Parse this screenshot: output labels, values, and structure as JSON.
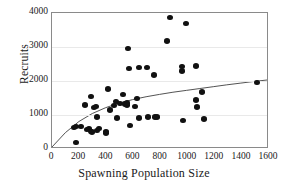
{
  "chart_data": {
    "type": "scatter",
    "title": "",
    "xlabel": "Spawning Population Size",
    "ylabel": "Recruits",
    "xlim": [
      0,
      1600
    ],
    "ylim": [
      0,
      4000
    ],
    "xticks": [
      0,
      200,
      400,
      600,
      800,
      1000,
      1200,
      1400,
      1600
    ],
    "yticks": [
      0,
      1000,
      2000,
      3000,
      4000
    ],
    "grid": "horizontal",
    "legend": "none",
    "marker_color": "#111111",
    "curve_color": "#404040",
    "points": [
      [
        175,
        195
      ],
      [
        165,
        640
      ],
      [
        180,
        670
      ],
      [
        215,
        660
      ],
      [
        240,
        1290
      ],
      [
        255,
        580
      ],
      [
        270,
        600
      ],
      [
        285,
        1550
      ],
      [
        290,
        510
      ],
      [
        295,
        495
      ],
      [
        310,
        1220
      ],
      [
        325,
        1255
      ],
      [
        330,
        940
      ],
      [
        335,
        545
      ],
      [
        345,
        600
      ],
      [
        395,
        510
      ],
      [
        400,
        470
      ],
      [
        410,
        1765
      ],
      [
        425,
        1145
      ],
      [
        455,
        1280
      ],
      [
        470,
        1400
      ],
      [
        480,
        910
      ],
      [
        500,
        1335
      ],
      [
        520,
        1605
      ],
      [
        540,
        1320
      ],
      [
        550,
        1290
      ],
      [
        555,
        1355
      ],
      [
        560,
        2950
      ],
      [
        565,
        2360
      ],
      [
        575,
        700
      ],
      [
        610,
        1250
      ],
      [
        630,
        1480
      ],
      [
        640,
        910
      ],
      [
        645,
        2390
      ],
      [
        700,
        2395
      ],
      [
        710,
        940
      ],
      [
        755,
        2180
      ],
      [
        760,
        945
      ],
      [
        775,
        940
      ],
      [
        850,
        3175
      ],
      [
        870,
        3865
      ],
      [
        955,
        2300
      ],
      [
        960,
        2420
      ],
      [
        965,
        830
      ],
      [
        985,
        3695
      ],
      [
        1060,
        1445
      ],
      [
        1065,
        2440
      ],
      [
        1070,
        1240
      ],
      [
        1105,
        1680
      ],
      [
        1120,
        880
      ],
      [
        1510,
        1960
      ]
    ],
    "fit_curve": {
      "description": "Beverton-Holt style asymptotic recruitment curve",
      "points": [
        [
          0,
          0
        ],
        [
          100,
          430
        ],
        [
          200,
          760
        ],
        [
          300,
          1000
        ],
        [
          400,
          1175
        ],
        [
          500,
          1310
        ],
        [
          600,
          1415
        ],
        [
          700,
          1500
        ],
        [
          800,
          1570
        ],
        [
          900,
          1635
        ],
        [
          1000,
          1690
        ],
        [
          1100,
          1745
        ],
        [
          1200,
          1800
        ],
        [
          1300,
          1855
        ],
        [
          1400,
          1905
        ],
        [
          1510,
          1960
        ],
        [
          1600,
          2000
        ]
      ]
    }
  }
}
